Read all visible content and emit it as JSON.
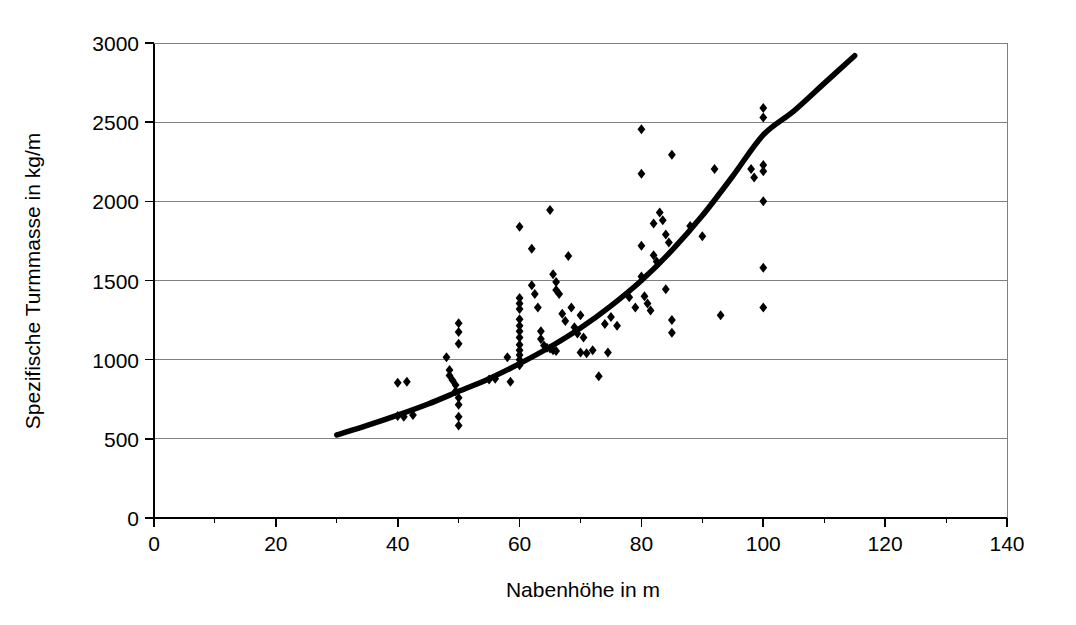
{
  "chart_data": {
    "type": "scatter",
    "title": "",
    "xlabel": "Nabenhöhe in m",
    "ylabel": "Spezifische Turmmasse in kg/m",
    "xlim": [
      0,
      140
    ],
    "ylim": [
      0,
      3000
    ],
    "xticks": [
      0,
      20,
      40,
      60,
      80,
      100,
      120,
      140
    ],
    "yticks": [
      0,
      500,
      1000,
      1500,
      2000,
      2500,
      3000
    ],
    "xtick_labels": [
      "0",
      "20",
      "40",
      "60",
      "80",
      "100",
      "120",
      "140"
    ],
    "ytick_labels": [
      "0",
      "500",
      "1000",
      "1500",
      "2000",
      "2500",
      "3000"
    ],
    "grid": "horizontal",
    "legend": "none",
    "marker": "diamond",
    "marker_color": "#000000",
    "series": [
      {
        "name": "Messwerte",
        "type": "scatter",
        "points": [
          [
            40,
            855
          ],
          [
            41.5,
            860
          ],
          [
            40,
            645
          ],
          [
            41,
            640
          ],
          [
            42.5,
            650
          ],
          [
            48,
            1015
          ],
          [
            48.5,
            935
          ],
          [
            48.5,
            900
          ],
          [
            49,
            870
          ],
          [
            49.5,
            840
          ],
          [
            49.5,
            800
          ],
          [
            50,
            760
          ],
          [
            50,
            715
          ],
          [
            50,
            1230
          ],
          [
            50,
            1175
          ],
          [
            50,
            1100
          ],
          [
            50,
            640
          ],
          [
            50,
            585
          ],
          [
            55,
            875
          ],
          [
            56,
            880
          ],
          [
            58,
            1015
          ],
          [
            58.5,
            860
          ],
          [
            60,
            1840
          ],
          [
            60,
            1390
          ],
          [
            60,
            1355
          ],
          [
            60,
            1320
          ],
          [
            60,
            1255
          ],
          [
            60,
            1215
          ],
          [
            60,
            1180
          ],
          [
            60,
            1140
          ],
          [
            60,
            1095
          ],
          [
            60,
            1060
          ],
          [
            60,
            1030
          ],
          [
            60,
            1000
          ],
          [
            60,
            965
          ],
          [
            62,
            1700
          ],
          [
            62,
            1470
          ],
          [
            62.5,
            1415
          ],
          [
            63,
            1330
          ],
          [
            63.5,
            1180
          ],
          [
            63.5,
            1130
          ],
          [
            64,
            1090
          ],
          [
            64.5,
            1075
          ],
          [
            65,
            1070
          ],
          [
            65.5,
            1060
          ],
          [
            66,
            1055
          ],
          [
            65,
            1945
          ],
          [
            65.5,
            1540
          ],
          [
            66,
            1490
          ],
          [
            66,
            1440
          ],
          [
            66.5,
            1415
          ],
          [
            67,
            1290
          ],
          [
            67.5,
            1245
          ],
          [
            68,
            1655
          ],
          [
            68.5,
            1330
          ],
          [
            69,
            1205
          ],
          [
            69.5,
            1165
          ],
          [
            70,
            1280
          ],
          [
            70.5,
            1140
          ],
          [
            70,
            1045
          ],
          [
            71,
            1040
          ],
          [
            72,
            1060
          ],
          [
            73,
            895
          ],
          [
            74,
            1225
          ],
          [
            74.5,
            1045
          ],
          [
            75,
            1270
          ],
          [
            76,
            1215
          ],
          [
            78,
            1395
          ],
          [
            79,
            1330
          ],
          [
            80,
            2455
          ],
          [
            80,
            2175
          ],
          [
            80,
            1720
          ],
          [
            80,
            1525
          ],
          [
            80.5,
            1400
          ],
          [
            81,
            1355
          ],
          [
            81.5,
            1310
          ],
          [
            82,
            1860
          ],
          [
            82,
            1660
          ],
          [
            82.5,
            1620
          ],
          [
            83,
            1930
          ],
          [
            83.5,
            1880
          ],
          [
            84,
            1790
          ],
          [
            84.5,
            1740
          ],
          [
            84,
            1445
          ],
          [
            85,
            1250
          ],
          [
            85,
            1170
          ],
          [
            85,
            2295
          ],
          [
            88,
            1845
          ],
          [
            90,
            1780
          ],
          [
            92,
            2205
          ],
          [
            93,
            1280
          ],
          [
            98,
            2205
          ],
          [
            98.5,
            2150
          ],
          [
            100,
            2590
          ],
          [
            100,
            2530
          ],
          [
            100,
            2230
          ],
          [
            100,
            2190
          ],
          [
            100,
            2000
          ],
          [
            100,
            1580
          ],
          [
            100,
            1330
          ]
        ]
      }
    ],
    "trendline": {
      "name": "Regressionskurve",
      "style": "solid",
      "color": "#000000",
      "width": 5.5,
      "x_start": 30,
      "x_end": 115,
      "points": [
        [
          30,
          525
        ],
        [
          35,
          585
        ],
        [
          40,
          650
        ],
        [
          45,
          720
        ],
        [
          50,
          800
        ],
        [
          55,
          880
        ],
        [
          60,
          975
        ],
        [
          65,
          1080
        ],
        [
          70,
          1200
        ],
        [
          75,
          1340
        ],
        [
          80,
          1500
        ],
        [
          85,
          1690
        ],
        [
          90,
          1910
        ],
        [
          95,
          2160
        ],
        [
          100,
          2420
        ],
        [
          105,
          2570
        ],
        [
          110,
          2745
        ],
        [
          115,
          2920
        ]
      ]
    }
  }
}
